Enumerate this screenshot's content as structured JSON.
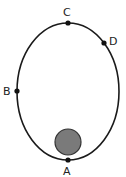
{
  "diagram": {
    "orbit": {
      "cx": 68,
      "cy": 91.5,
      "rx": 51,
      "ry": 68.5,
      "stroke": "#1a1a1a"
    },
    "central_body": {
      "cx": 68,
      "cy": 142,
      "r": 13,
      "fill": "#7a7a7a",
      "stroke": "#333333"
    },
    "points": [
      {
        "label": "A",
        "x": 68,
        "y": 160,
        "label_x": 63,
        "label_y": 175
      },
      {
        "label": "B",
        "x": 17,
        "y": 91,
        "label_x": 3,
        "label_y": 95
      },
      {
        "label": "C",
        "x": 68,
        "y": 23,
        "label_x": 63,
        "label_y": 16
      },
      {
        "label": "D",
        "x": 104,
        "y": 43,
        "label_x": 109,
        "label_y": 45
      }
    ]
  }
}
